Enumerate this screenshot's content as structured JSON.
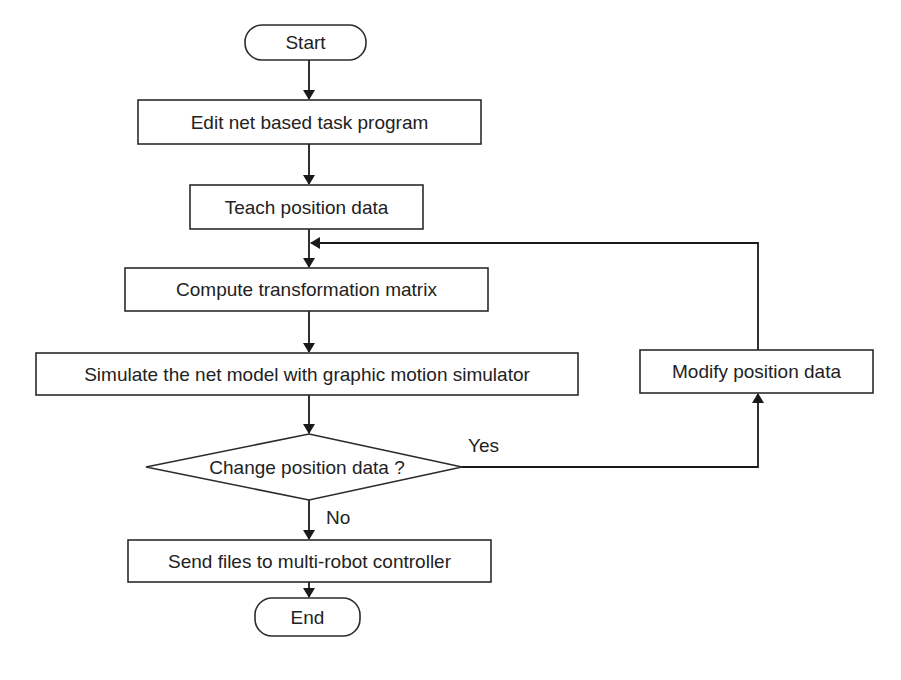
{
  "diagram": {
    "type": "flowchart",
    "nodes": {
      "start": {
        "shape": "terminator",
        "label": "Start"
      },
      "edit": {
        "shape": "process",
        "label": "Edit net based task program"
      },
      "teach": {
        "shape": "process",
        "label": "Teach position data"
      },
      "compute": {
        "shape": "process",
        "label": "Compute transformation matrix"
      },
      "simulate": {
        "shape": "process",
        "label": "Simulate the net model with graphic motion simulator"
      },
      "decision": {
        "shape": "decision",
        "label": "Change position data ?"
      },
      "modify": {
        "shape": "process",
        "label": "Modify position data"
      },
      "send": {
        "shape": "process",
        "label": "Send files to multi-robot controller"
      },
      "end": {
        "shape": "terminator",
        "label": "End"
      }
    },
    "edges": [
      {
        "from": "start",
        "to": "edit"
      },
      {
        "from": "edit",
        "to": "teach"
      },
      {
        "from": "teach",
        "to": "compute"
      },
      {
        "from": "compute",
        "to": "simulate"
      },
      {
        "from": "simulate",
        "to": "decision"
      },
      {
        "from": "decision",
        "to": "modify",
        "label": "Yes"
      },
      {
        "from": "modify",
        "to": "compute",
        "note": "loop back joins line between teach and compute"
      },
      {
        "from": "decision",
        "to": "send",
        "label": "No"
      },
      {
        "from": "send",
        "to": "end"
      }
    ],
    "edge_labels": {
      "yes": "Yes",
      "no": "No"
    }
  },
  "caption": {
    "visible_text": ""
  }
}
